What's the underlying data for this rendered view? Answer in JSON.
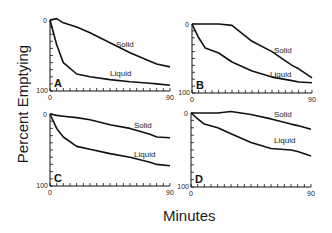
{
  "figure": {
    "ylabel": "Percent Emptying",
    "xlabel": "Minutes",
    "line_color": "#111111",
    "background": "#ffffff"
  },
  "chart_data": [
    {
      "type": "line",
      "panel": "A",
      "xlabel": "Minutes",
      "ylabel": "Percent Emptying",
      "xlim": [
        0,
        90
      ],
      "ylim": [
        100,
        0
      ],
      "x_tick_labels": [
        "0",
        "90"
      ],
      "y_tick_labels": [
        "0",
        "100"
      ],
      "grid": false,
      "x": [
        0,
        5,
        10,
        20,
        30,
        45,
        60,
        75,
        80,
        90
      ],
      "series": [
        {
          "name": "Solid",
          "values": [
            0,
            -2,
            4,
            10,
            18,
            32,
            46,
            58,
            62,
            66
          ]
        },
        {
          "name": "Liquid",
          "values": [
            0,
            35,
            60,
            76,
            80,
            84,
            87,
            89,
            90,
            92
          ]
        }
      ]
    },
    {
      "type": "line",
      "panel": "B",
      "xlabel": "Minutes",
      "ylabel": "Percent Emptying",
      "xlim": [
        0,
        90
      ],
      "ylim": [
        100,
        0
      ],
      "x_tick_labels": [
        "0",
        "90"
      ],
      "y_tick_labels": [
        "0",
        "100"
      ],
      "grid": false,
      "x": [
        0,
        5,
        10,
        20,
        30,
        45,
        60,
        75,
        80,
        90
      ],
      "series": [
        {
          "name": "Solid",
          "values": [
            0,
            0,
            0,
            0,
            2,
            25,
            40,
            60,
            65,
            78
          ]
        },
        {
          "name": "Liquid",
          "values": [
            0,
            20,
            35,
            42,
            55,
            68,
            77,
            82,
            84,
            85
          ]
        }
      ]
    },
    {
      "type": "line",
      "panel": "C",
      "xlabel": "Minutes",
      "ylabel": "Percent Emptying",
      "xlim": [
        0,
        90
      ],
      "ylim": [
        100,
        0
      ],
      "x_tick_labels": [
        "0",
        "90"
      ],
      "y_tick_labels": [
        "0",
        "100"
      ],
      "grid": false,
      "x": [
        0,
        5,
        10,
        20,
        30,
        45,
        60,
        75,
        80,
        90
      ],
      "series": [
        {
          "name": "Solid",
          "values": [
            0,
            2,
            3,
            5,
            8,
            15,
            20,
            28,
            32,
            33
          ]
        },
        {
          "name": "Liquid",
          "values": [
            0,
            20,
            32,
            45,
            49,
            55,
            60,
            67,
            70,
            72
          ]
        }
      ]
    },
    {
      "type": "line",
      "panel": "D",
      "xlabel": "Minutes",
      "ylabel": "Percent Emptying",
      "xlim": [
        0,
        90
      ],
      "ylim": [
        100,
        0
      ],
      "x_tick_labels": [
        "0",
        "90"
      ],
      "y_tick_labels": [
        "0",
        "100"
      ],
      "grid": false,
      "x": [
        0,
        5,
        10,
        20,
        30,
        45,
        60,
        75,
        80,
        90
      ],
      "series": [
        {
          "name": "Solid",
          "values": [
            0,
            0,
            0,
            0,
            -2,
            2,
            8,
            15,
            17,
            22
          ]
        },
        {
          "name": "Liquid",
          "values": [
            0,
            8,
            15,
            20,
            28,
            40,
            48,
            50,
            52,
            58
          ]
        }
      ]
    }
  ],
  "panels": [
    {
      "label": "A",
      "tick_x_start": "0",
      "tick_x_end": "90",
      "tick_y_top": "0",
      "tick_y_bottom": "100",
      "solid_label": "Solid",
      "liquid_label": "Liquid"
    },
    {
      "label": "B",
      "tick_x_start": "0",
      "tick_x_end": "90",
      "tick_y_top": "0",
      "tick_y_bottom": "100",
      "solid_label": "Solid",
      "liquid_label": "Liquid"
    },
    {
      "label": "C",
      "tick_x_start": "0",
      "tick_x_end": "90",
      "tick_y_top": "0",
      "tick_y_bottom": "100",
      "solid_label": "Solid",
      "liquid_label": "Liquid"
    },
    {
      "label": "D",
      "tick_x_start": "0",
      "tick_x_end": "90",
      "tick_y_top": "0",
      "tick_y_bottom": "100",
      "solid_label": "Solid",
      "liquid_label": "Liquid"
    }
  ]
}
